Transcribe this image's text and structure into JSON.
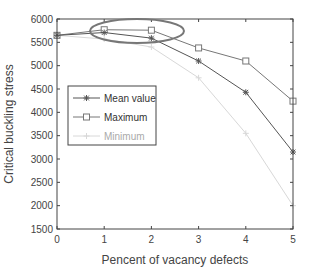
{
  "chart_data": {
    "type": "line",
    "title": "",
    "xlabel": "Pencent of vacancy defects",
    "ylabel": "Critical buckling stress",
    "x": [
      0,
      1,
      2,
      3,
      4,
      5
    ],
    "xlim": [
      0,
      5
    ],
    "ylim": [
      1500,
      6000
    ],
    "xticks": [
      "0",
      "1",
      "2",
      "3",
      "4",
      "5"
    ],
    "yticks": [
      "1500",
      "2000",
      "2500",
      "3000",
      "3500",
      "4000",
      "4500",
      "5000",
      "5500",
      "6000"
    ],
    "grid": false,
    "legend_position": "inside-left",
    "series": [
      {
        "name": "Mean value",
        "marker": "asterisk",
        "color": "#555555",
        "values": [
          5650,
          5710,
          5590,
          5100,
          4430,
          3150
        ]
      },
      {
        "name": "Maximum",
        "marker": "square",
        "color": "#777777",
        "values": [
          5650,
          5770,
          5760,
          5380,
          5100,
          4240
        ]
      },
      {
        "name": "Minimum",
        "marker": "plus",
        "color": "#d8d8d8",
        "values": [
          5650,
          5570,
          5400,
          4740,
          3550,
          2000
        ]
      }
    ],
    "annotations": [
      {
        "type": "ellipse",
        "description": "highlight around x=1..2 near top",
        "color": "#777777"
      }
    ]
  }
}
